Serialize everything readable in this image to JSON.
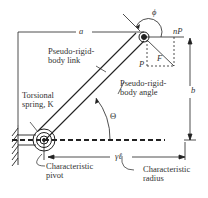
{
  "diagram": {
    "labels": {
      "a": "a",
      "b": "b",
      "phi": "ϕ",
      "nP": "nP",
      "P": "P",
      "F": "F",
      "link_line1": "Pseudo-rigid-",
      "link_line2": "body link",
      "angle_line1": "Pseudo-rigid-",
      "angle_line2": "body angle",
      "theta": "Θ",
      "spring_line1": "Torsional",
      "spring_line2": "spring, K",
      "pivot_line1": "Characteristic",
      "pivot_line2": "pivot",
      "gamma_l": "γℓ",
      "radius_line1": "Characteristic",
      "radius_line2": "radius"
    },
    "colors": {
      "stroke": "#222222",
      "text": "#333333"
    }
  }
}
